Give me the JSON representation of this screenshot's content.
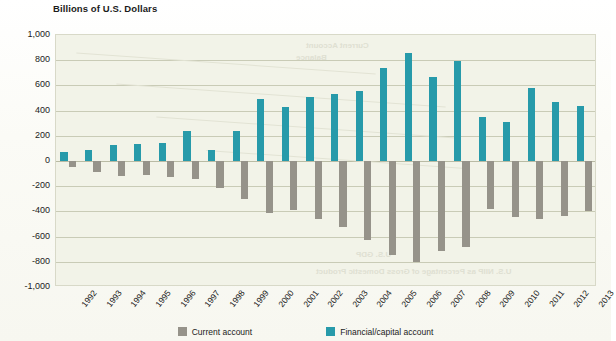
{
  "chart_data": {
    "type": "bar",
    "title": "Billions of U.S. Dollars",
    "xlabel": "",
    "ylabel": "Billions of U.S. Dollars",
    "ylim": [
      -1000,
      1000
    ],
    "ytick_step": 200,
    "grid": true,
    "legend_position": "bottom",
    "categories": [
      "1992",
      "1993",
      "1994",
      "1995",
      "1996",
      "1997",
      "1998",
      "1999",
      "2000",
      "2001",
      "2002",
      "2003",
      "2004",
      "2005",
      "2006",
      "2007",
      "2008",
      "2009",
      "2010",
      "2011",
      "2012",
      "2013"
    ],
    "ytick_labels": [
      "1,000",
      "800",
      "600",
      "400",
      "200",
      "0",
      "-200",
      "-400",
      "-600",
      "-800",
      "-1,000"
    ],
    "ytick_values": [
      1000,
      800,
      600,
      400,
      200,
      0,
      -200,
      -400,
      -600,
      -800,
      -1000
    ],
    "series": [
      {
        "name": "Current account",
        "key": "cur",
        "color": "#96938a",
        "values": [
          -50,
          -85,
          -120,
          -115,
          -125,
          -140,
          -215,
          -300,
          -415,
          -390,
          -460,
          -520,
          -630,
          -745,
          -805,
          -715,
          -685,
          -380,
          -445,
          -460,
          -440,
          -400
        ]
      },
      {
        "name": "Financial/capital account",
        "key": "fin",
        "color": "#279aaa",
        "values": [
          75,
          90,
          130,
          135,
          140,
          235,
          90,
          240,
          495,
          430,
          505,
          530,
          555,
          740,
          855,
          665,
          790,
          350,
          310,
          580,
          465,
          440
        ]
      }
    ],
    "legend": [
      {
        "label": "Current account",
        "key": "cur",
        "color": "#96938a"
      },
      {
        "label": "Financial/capital account",
        "key": "fin",
        "color": "#279aaa"
      }
    ]
  }
}
